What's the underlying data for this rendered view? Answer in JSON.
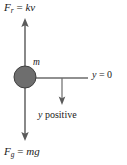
{
  "figure": {
    "kind": "free-body-diagram",
    "background_color": "#ffffff",
    "stroke_color": "#4d4d4d",
    "text_color": "#1a1a1a"
  },
  "mass": {
    "label": "m",
    "fill_color": "#6e6e6e",
    "outline_color": "#3f3f3f",
    "center_x": 25,
    "center_y": 77,
    "radius": 11
  },
  "forces": [
    {
      "name": "resistive-force",
      "symbol": "F",
      "subscript": "r",
      "equals": "=",
      "expression": "kv",
      "full_label": "F_r = kv",
      "direction": "up",
      "tail_x": 25,
      "tail_y": 67,
      "head_x": 25,
      "head_y": 19
    },
    {
      "name": "gravitational-force",
      "symbol": "F",
      "subscript": "g",
      "equals": "=",
      "expression": "mg",
      "full_label": "F_g = mg",
      "direction": "down",
      "tail_x": 25,
      "tail_y": 87,
      "head_x": 25,
      "head_y": 140
    }
  ],
  "axes": {
    "origin_line": {
      "name": "y-zero-line",
      "label": "y = 0",
      "symbol": "y",
      "equals": "=",
      "value": "0",
      "start_x": 25,
      "start_y": 78,
      "end_x": 88,
      "end_y": 78
    },
    "positive_direction": {
      "name": "y-positive-arrow",
      "label": "y positive",
      "symbol": "y",
      "word": "positive",
      "direction": "down",
      "tail_x": 62,
      "tail_y": 78,
      "head_x": 62,
      "head_y": 104
    }
  }
}
